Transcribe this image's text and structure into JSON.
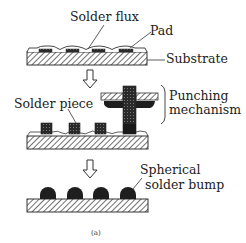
{
  "figure": {
    "caption": "(a)",
    "stages": [
      {
        "id": "stage-1",
        "labels": {
          "flux": "Solder flux",
          "pad": "Pad",
          "substrate": "Substrate"
        }
      },
      {
        "id": "stage-2",
        "labels": {
          "solder_piece": "Solder  piece",
          "punching_line1": "Punching",
          "punching_line2": "mechanism"
        }
      },
      {
        "id": "stage-3",
        "labels": {
          "bump_line1": "Spherical",
          "bump_line2": "solder bump"
        }
      }
    ],
    "colors": {
      "line": "#333333",
      "solder": "#1e1e1e",
      "pad": "#555555",
      "background": "#ffffff"
    }
  }
}
